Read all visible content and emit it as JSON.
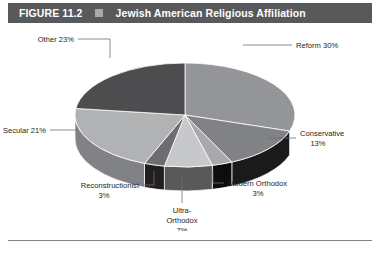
{
  "figure": {
    "number": "FIGURE 11.2",
    "bullet_icon": "square-bullet-icon",
    "title": "Jewish American Religious Affiliation"
  },
  "chart_data": {
    "type": "pie",
    "title": "Jewish American Religious Affiliation",
    "style": "3d-exploded-none",
    "legend": "none",
    "labels_position": "outside-with-leader-lines",
    "unit": "percent",
    "categories": [
      "Reform",
      "Conservative",
      "Modern Orthodox",
      "Ultra-Orthodox",
      "Reconstructionist",
      "Secular",
      "Other"
    ],
    "values": [
      30,
      13,
      3,
      7,
      3,
      21,
      23
    ],
    "slices": [
      {
        "name": "Reform",
        "value": 30,
        "label": "Reform 30%",
        "value_label": "30%",
        "top_color": "#939598",
        "side_color": "#6d6e71"
      },
      {
        "name": "Conservative",
        "value": 13,
        "label": "Conservative",
        "value_label": "13%",
        "top_color": "#808285",
        "side_color": "#1a1a1a"
      },
      {
        "name": "Modern Orthodox",
        "value": 3,
        "label": "Modern Orthodox",
        "value_label": "3%",
        "top_color": "#a7a9ac",
        "side_color": "#0d0d0d"
      },
      {
        "name": "Ultra-Orthodox",
        "label_line1": "Ultra-",
        "label_line2": "Orthodox",
        "value": 7,
        "value_label": "7%",
        "top_color": "#c7c8ca",
        "side_color": "#58595b"
      },
      {
        "name": "Reconstructionist",
        "value": 3,
        "label": "Reconstructionist",
        "value_label": "3%",
        "top_color": "#6d6e71",
        "side_color": "#231f20"
      },
      {
        "name": "Secular",
        "value": 21,
        "label": "Secular 21%",
        "value_label": "21%",
        "top_color": "#b0b2b4",
        "side_color": "#808285"
      },
      {
        "name": "Other",
        "value": 23,
        "label": "Other 23%",
        "value_label": "23%",
        "top_color": "#4d4d4f",
        "side_color": "#3a3a3c"
      }
    ],
    "colors": {
      "background": "#ffffff",
      "header_bar": "#58595b",
      "header_text": "#ffffff",
      "bullet": "#a7a9ac",
      "label_text": "#231f20",
      "leader_line": "#6d6e71",
      "rule": "#808285"
    }
  }
}
